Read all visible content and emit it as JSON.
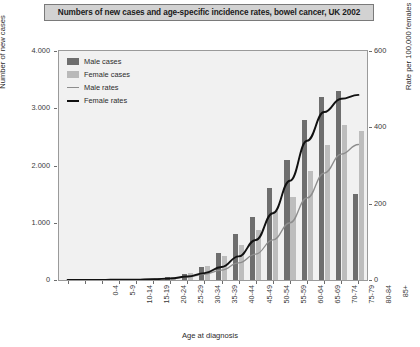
{
  "chart_data": {
    "type": "bar",
    "title": "Numbers of new cases and age-specific incidence rates, bowel cancer, UK 2002",
    "xlabel": "Age at diagnosis",
    "ylabel": "Number of new cases",
    "ylabel_right": "Rate per 100,000 females",
    "categories": [
      "0-4",
      "5-9",
      "10-14",
      "15-19",
      "20-24",
      "25-29",
      "30-34",
      "35-39",
      "40-44",
      "45-49",
      "50-54",
      "55-59",
      "60-64",
      "65-69",
      "70-74",
      "75-79",
      "80-84",
      "85+"
    ],
    "ylim": [
      0,
      4000
    ],
    "yticks": [
      "0",
      "1.000",
      "2.000",
      "3.000",
      "4.000"
    ],
    "ylim_right": [
      0,
      600
    ],
    "yticks_right": [
      "0",
      "200",
      "400",
      "600"
    ],
    "grid": false,
    "legend_position": "top-left",
    "series": [
      {
        "name": "Male cases",
        "type": "bar",
        "color": "#6e6e6e",
        "axis": "left",
        "values": [
          2,
          3,
          5,
          8,
          14,
          26,
          52,
          110,
          230,
          470,
          800,
          1100,
          1600,
          2100,
          2800,
          3200,
          3300,
          1500
        ]
      },
      {
        "name": "Female cases",
        "type": "bar",
        "color": "#bdbdbd",
        "axis": "left",
        "values": [
          2,
          3,
          5,
          8,
          14,
          30,
          60,
          120,
          250,
          420,
          620,
          880,
          1200,
          1450,
          1900,
          2350,
          2700,
          2600
        ]
      },
      {
        "name": "Male rates",
        "type": "line",
        "color": "#8d8d8d",
        "axis": "right",
        "values": [
          0,
          0,
          0,
          1,
          1,
          2,
          4,
          8,
          15,
          26,
          45,
          68,
          105,
          150,
          215,
          280,
          330,
          355
        ]
      },
      {
        "name": "Female rates",
        "type": "line",
        "color": "#111111",
        "axis": "right",
        "values": [
          0,
          0,
          0,
          1,
          1,
          2,
          4,
          9,
          18,
          34,
          62,
          105,
          175,
          260,
          365,
          440,
          475,
          485
        ]
      }
    ]
  },
  "legend": {
    "items": [
      {
        "label": "Male cases",
        "kind": "swatch-dark"
      },
      {
        "label": "Female cases",
        "kind": "swatch-light"
      },
      {
        "label": "Male rates",
        "kind": "line-gray"
      },
      {
        "label": "Female rates",
        "kind": "line-black"
      }
    ]
  }
}
